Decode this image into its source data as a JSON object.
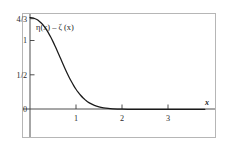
{
  "figure": {
    "title": "",
    "frame_color": "#b4b4b4",
    "axis_color": "#3a3a3a",
    "curve_color": "#1a1a1a",
    "background": "#ffffff"
  },
  "curve_label": {
    "text": "η(x) – ζ (x)",
    "x_px": 35,
    "y_px": 28
  },
  "x_axis": {
    "name": "x",
    "tick_labels": [
      "1",
      "2",
      "3"
    ],
    "tick_values": [
      1,
      2,
      3
    ],
    "range": [
      -0.12,
      3.85
    ],
    "zero_label": "0"
  },
  "y_axis": {
    "tick_labels": [
      "4/3",
      "1",
      "1/2",
      "0"
    ],
    "tick_values": [
      1.3333,
      1,
      0.5,
      0
    ],
    "range": [
      -0.42,
      1.42
    ]
  },
  "chart_data": {
    "type": "line",
    "title": "",
    "xlabel": "x",
    "ylabel": "",
    "xlim": [
      -0.12,
      3.85
    ],
    "ylim": [
      -0.42,
      1.42
    ],
    "grid": false,
    "legend": null,
    "annotations": [
      {
        "text": "η(x) – ζ (x)",
        "x": 0.25,
        "y": 1.18
      },
      {
        "text": "x",
        "x": 3.62,
        "y": 0.1
      }
    ],
    "xticks": [
      1,
      2,
      3
    ],
    "xticklabels": [
      "1",
      "2",
      "3"
    ],
    "yticks": [
      0,
      0.5,
      1,
      1.3333
    ],
    "yticklabels": [
      "0",
      "1/2",
      "1",
      "4/3"
    ],
    "series": [
      {
        "name": "η(x) – ζ (x)",
        "x": [
          0.0,
          0.05,
          0.1,
          0.15,
          0.2,
          0.25,
          0.3,
          0.35,
          0.4,
          0.45,
          0.5,
          0.55,
          0.6,
          0.65,
          0.7,
          0.75,
          0.8,
          0.85,
          0.9,
          0.95,
          1.0,
          1.05,
          1.1,
          1.15,
          1.2,
          1.25,
          1.3,
          1.4,
          1.5,
          1.6,
          1.7,
          1.8,
          1.9,
          2.0,
          2.2,
          2.4,
          2.6,
          2.8,
          3.0,
          3.2,
          3.4,
          3.6,
          3.8
        ],
        "y": [
          1.3333,
          1.3305,
          1.3215,
          1.3055,
          1.2825,
          1.2515,
          1.2125,
          1.1655,
          1.1115,
          1.0505,
          0.9835,
          0.9115,
          0.8365,
          0.7595,
          0.6825,
          0.6065,
          0.5335,
          0.4645,
          0.4005,
          0.3415,
          0.2885,
          0.2415,
          0.2005,
          0.1645,
          0.1335,
          0.1075,
          0.0855,
          0.0525,
          0.0305,
          0.0165,
          0.0075,
          0.0025,
          -0.0005,
          -0.0025,
          -0.0045,
          -0.0055,
          -0.0058,
          -0.006,
          -0.006,
          -0.006,
          -0.006,
          -0.006,
          -0.006
        ]
      }
    ]
  },
  "geometry": {
    "frame": {
      "x": 22,
      "y": 13,
      "w": 194,
      "h": 125
    },
    "origin": {
      "x": 30,
      "y": 109
    },
    "x_unit_px": 46.0,
    "y_unit_px": 68.5
  }
}
